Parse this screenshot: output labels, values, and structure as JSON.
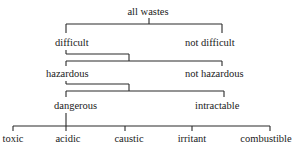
{
  "diagram": {
    "type": "classification-tree",
    "root": "all wastes",
    "levels": [
      {
        "parent": "all wastes",
        "children": [
          "difficult",
          "not difficult"
        ]
      },
      {
        "parent": "difficult",
        "children": [
          "hazardous",
          "not hazardous"
        ]
      },
      {
        "parent": "hazardous",
        "children": [
          "dangerous",
          "intractable"
        ]
      },
      {
        "parent": "dangerous",
        "children": [
          "toxic",
          "acidic",
          "caustic",
          "irritant",
          "combustible"
        ]
      }
    ],
    "nodes": {
      "all_wastes": "all wastes",
      "difficult": "difficult",
      "not_difficult": "not difficult",
      "hazardous": "hazardous",
      "not_hazardous": "not hazardous",
      "dangerous": "dangerous",
      "intractable": "intractable",
      "toxic": "toxic",
      "acidic": "acidic",
      "caustic": "caustic",
      "irritant": "irritant",
      "combustible": "combustible"
    },
    "colors": {
      "ink": "#1a1a1a",
      "background": "#ffffff"
    }
  }
}
